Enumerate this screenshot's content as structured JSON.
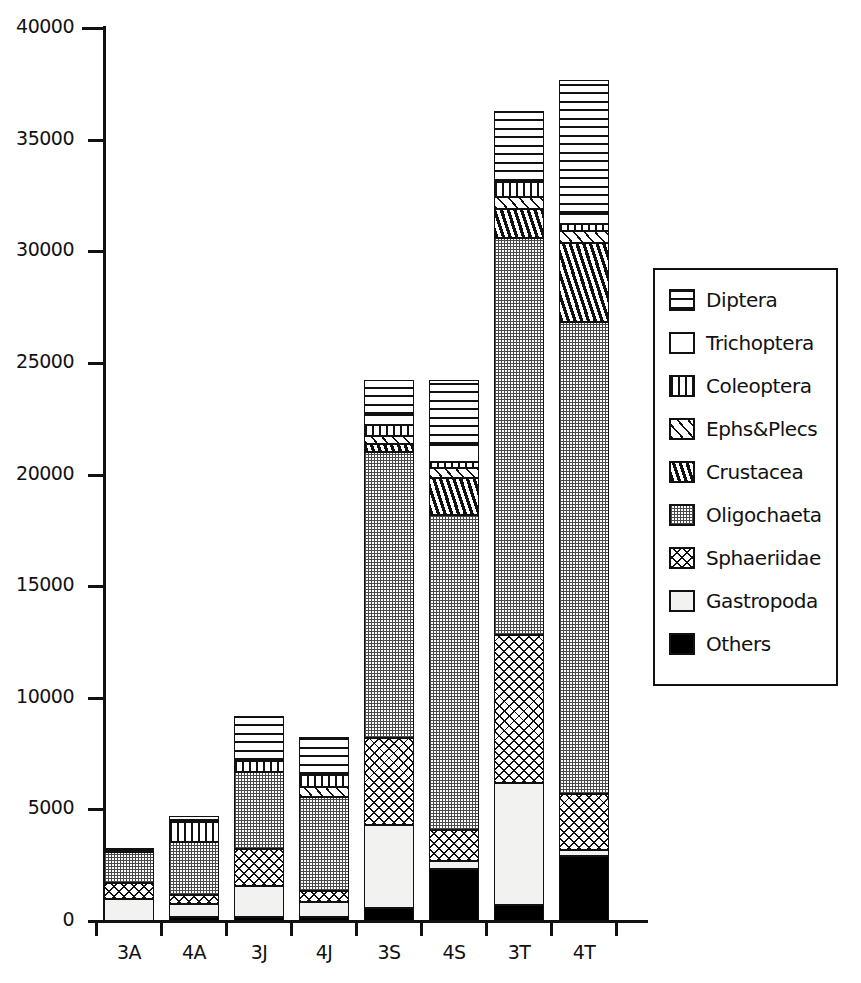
{
  "chart_data": {
    "type": "bar",
    "subtype": "stacked-bar",
    "title": "",
    "xlabel": "",
    "ylabel": "",
    "ylim": [
      0,
      40000
    ],
    "ytick_step": 5000,
    "yticks": [
      "0",
      "5000",
      "10000",
      "15000",
      "20000",
      "25000",
      "30000",
      "35000",
      "40000"
    ],
    "grid": false,
    "legend_position": "right",
    "categories": [
      "3A",
      "4A",
      "3J",
      "4J",
      "3S",
      "4S",
      "3T",
      "4T"
    ],
    "series": [
      {
        "name": "Others",
        "pattern": "solid-black",
        "values": [
          0,
          180,
          180,
          180,
          560,
          2350,
          700,
          2900
        ]
      },
      {
        "name": "Gastropoda",
        "pattern": "empty-light",
        "values": [
          1000,
          600,
          1400,
          680,
          3750,
          330,
          5500,
          260
        ]
      },
      {
        "name": "Sphaeriidae",
        "pattern": "cross-hatch",
        "values": [
          700,
          400,
          1650,
          500,
          3900,
          1400,
          6600,
          2550
        ]
      },
      {
        "name": "Oligochaeta",
        "pattern": "fine-dots",
        "values": [
          1400,
          2350,
          3450,
          4200,
          12800,
          14100,
          17800,
          21100
        ]
      },
      {
        "name": "Crustacea",
        "pattern": "thick-diagonal",
        "values": [
          0,
          0,
          0,
          0,
          350,
          1650,
          1300,
          3550
        ]
      },
      {
        "name": "Ephs&Plecs",
        "pattern": "diagonal-hatch",
        "values": [
          0,
          0,
          0,
          450,
          350,
          450,
          550,
          550
        ]
      },
      {
        "name": "Coleoptera",
        "pattern": "vertical-lines",
        "values": [
          0,
          900,
          500,
          550,
          500,
          300,
          650,
          300
        ]
      },
      {
        "name": "Trichoptera",
        "pattern": "empty-white",
        "values": [
          0,
          0,
          0,
          0,
          450,
          750,
          0,
          450
        ]
      },
      {
        "name": "Diptera",
        "pattern": "wavy-lines",
        "values": [
          170,
          270,
          2000,
          1700,
          1580,
          2920,
          3200,
          6000
        ]
      }
    ],
    "totals": [
      3270,
      4700,
      9180,
      8260,
      24240,
      24250,
      36300,
      37660
    ]
  },
  "legend": {
    "items": [
      {
        "label": "Diptera",
        "pattern": "wavy-lines"
      },
      {
        "label": "Trichoptera",
        "pattern": "empty-white"
      },
      {
        "label": "Coleoptera",
        "pattern": "vertical-lines"
      },
      {
        "label": "Ephs&Plecs",
        "pattern": "diagonal-hatch"
      },
      {
        "label": "Crustacea",
        "pattern": "thick-diagonal"
      },
      {
        "label": "Oligochaeta",
        "pattern": "fine-dots"
      },
      {
        "label": "Sphaeriidae",
        "pattern": "cross-hatch"
      },
      {
        "label": "Gastropoda",
        "pattern": "empty-light"
      },
      {
        "label": "Others",
        "pattern": "solid-black"
      }
    ]
  }
}
